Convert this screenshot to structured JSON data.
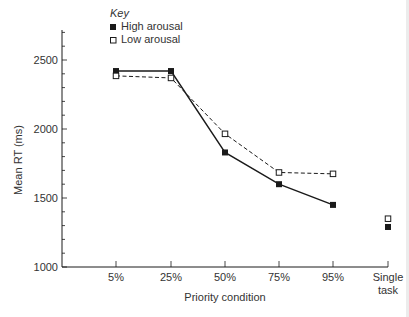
{
  "chart_data": {
    "type": "line",
    "title": "",
    "xlabel": "Priority condition",
    "ylabel": "Mean RT (ms)",
    "categories": [
      "5%",
      "25%",
      "50%",
      "75%",
      "95%",
      "Single task"
    ],
    "x_tick_labels": [
      [
        "5%"
      ],
      [
        "25%"
      ],
      [
        "50%"
      ],
      [
        "75%"
      ],
      [
        "95%"
      ],
      [
        "Single",
        "task"
      ]
    ],
    "y_ticks": [
      1000,
      1500,
      2000,
      2500
    ],
    "y_tick_labels": [
      "1000",
      "1500",
      "2000",
      "2500"
    ],
    "ylim": [
      1000,
      2700
    ],
    "minor_tick_step": 100,
    "grid": false,
    "legend": {
      "title": "Key",
      "position": "top-left",
      "entries": [
        "High arousal",
        "Low arousal"
      ]
    },
    "series": [
      {
        "name": "High arousal",
        "marker": "filled-square",
        "line": "solid",
        "values": [
          2420,
          2420,
          1830,
          1600,
          1450,
          1290
        ],
        "connected_points": 5
      },
      {
        "name": "Low arousal",
        "marker": "open-square",
        "line": "dashed",
        "values": [
          2385,
          2370,
          1965,
          1685,
          1675,
          1350
        ],
        "connected_points": 5
      }
    ],
    "colors": {
      "ink": "#1a1a1a",
      "background": "#ffffff"
    }
  }
}
